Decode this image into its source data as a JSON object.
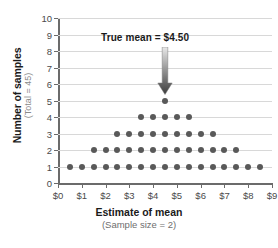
{
  "chart_data": {
    "type": "scatter",
    "title": "",
    "annotation": {
      "label": "True mean  =  $4.50",
      "value": 4.5,
      "arrow": "down-arrow"
    },
    "xlabel": "Estimate of mean",
    "xsublabel": "(Sample size = 2)",
    "ylabel": "Number of samples",
    "ysublabel": "(Total = 45)",
    "xlim": [
      0,
      9
    ],
    "ylim": [
      0,
      10
    ],
    "xticklabels": [
      "$0",
      "$1",
      "$2",
      "$3",
      "$4",
      "$5",
      "$6",
      "$7",
      "$8",
      "$9"
    ],
    "xtickvalues": [
      0,
      1,
      2,
      3,
      4,
      5,
      6,
      7,
      8,
      9
    ],
    "yticklabels": [
      "0",
      "1",
      "2",
      "3",
      "4",
      "5",
      "6",
      "7",
      "8",
      "9",
      "10"
    ],
    "ytickvalues": [
      0,
      1,
      2,
      3,
      4,
      5,
      6,
      7,
      8,
      9,
      10
    ],
    "grid": "horizontal",
    "legend": "none",
    "total_samples": 45,
    "dot_color": "#595959",
    "grid_color": "#d8d8d8",
    "axis_color": "#6b6b6b",
    "rows": [
      {
        "count": 1,
        "x_start": 0.5,
        "x_end": 8.5,
        "n_dots": 17
      },
      {
        "count": 2,
        "x_start": 1.5,
        "x_end": 7.5,
        "n_dots": 13
      },
      {
        "count": 3,
        "x_start": 2.5,
        "x_end": 6.5,
        "n_dots": 9
      },
      {
        "count": 4,
        "x_start": 3.5,
        "x_end": 5.5,
        "n_dots": 5
      },
      {
        "count": 5,
        "x_start": 4.5,
        "x_end": 4.5,
        "n_dots": 1
      }
    ],
    "points": [
      {
        "x": 0.5,
        "y": 1
      },
      {
        "x": 1.0,
        "y": 1
      },
      {
        "x": 1.5,
        "y": 1
      },
      {
        "x": 2.0,
        "y": 1
      },
      {
        "x": 2.5,
        "y": 1
      },
      {
        "x": 3.0,
        "y": 1
      },
      {
        "x": 3.5,
        "y": 1
      },
      {
        "x": 4.0,
        "y": 1
      },
      {
        "x": 4.5,
        "y": 1
      },
      {
        "x": 5.0,
        "y": 1
      },
      {
        "x": 5.5,
        "y": 1
      },
      {
        "x": 6.0,
        "y": 1
      },
      {
        "x": 6.5,
        "y": 1
      },
      {
        "x": 7.0,
        "y": 1
      },
      {
        "x": 7.5,
        "y": 1
      },
      {
        "x": 8.0,
        "y": 1
      },
      {
        "x": 8.5,
        "y": 1
      },
      {
        "x": 1.5,
        "y": 2
      },
      {
        "x": 2.0,
        "y": 2
      },
      {
        "x": 2.5,
        "y": 2
      },
      {
        "x": 3.0,
        "y": 2
      },
      {
        "x": 3.5,
        "y": 2
      },
      {
        "x": 4.0,
        "y": 2
      },
      {
        "x": 4.5,
        "y": 2
      },
      {
        "x": 5.0,
        "y": 2
      },
      {
        "x": 5.5,
        "y": 2
      },
      {
        "x": 6.0,
        "y": 2
      },
      {
        "x": 6.5,
        "y": 2
      },
      {
        "x": 7.0,
        "y": 2
      },
      {
        "x": 7.5,
        "y": 2
      },
      {
        "x": 2.5,
        "y": 3
      },
      {
        "x": 3.0,
        "y": 3
      },
      {
        "x": 3.5,
        "y": 3
      },
      {
        "x": 4.0,
        "y": 3
      },
      {
        "x": 4.5,
        "y": 3
      },
      {
        "x": 5.0,
        "y": 3
      },
      {
        "x": 5.5,
        "y": 3
      },
      {
        "x": 6.0,
        "y": 3
      },
      {
        "x": 6.5,
        "y": 3
      },
      {
        "x": 3.5,
        "y": 4
      },
      {
        "x": 4.0,
        "y": 4
      },
      {
        "x": 4.5,
        "y": 4
      },
      {
        "x": 5.0,
        "y": 4
      },
      {
        "x": 5.5,
        "y": 4
      },
      {
        "x": 4.5,
        "y": 5
      }
    ]
  }
}
